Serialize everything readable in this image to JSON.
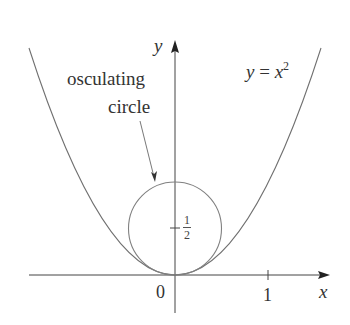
{
  "figure": {
    "curve_label": {
      "lhs": "y",
      "eq": " = ",
      "rhs": "x",
      "exp": "2"
    },
    "circle_label": {
      "line1": "osculating",
      "line2": "circle"
    },
    "axes": {
      "x_label": "x",
      "y_label": "y",
      "origin_label": "0",
      "x_tick_label": "1"
    },
    "y_tick_label": {
      "numerator": "1",
      "denominator": "2"
    },
    "colors": {
      "curve": "#707070",
      "axes": "#444444",
      "text": "#333333"
    }
  }
}
